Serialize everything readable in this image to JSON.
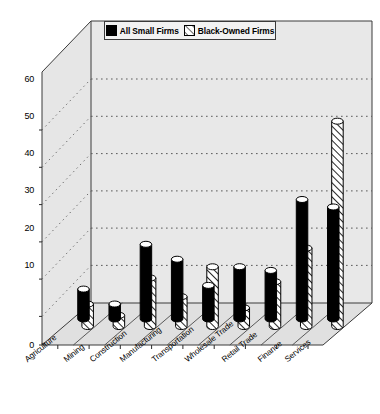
{
  "chart_data": {
    "type": "bar",
    "title": "",
    "subtitle": "",
    "xlabel": "",
    "ylabel": "",
    "ylim": [
      0,
      60
    ],
    "ytick_values": [
      0,
      10,
      20,
      30,
      40,
      50,
      60
    ],
    "ytick_labels": [
      "0",
      "10",
      "20",
      "30",
      "40",
      "50",
      "60"
    ],
    "grid": true,
    "grid_style": "dotted horizontal gridlines on back wall",
    "projection": "3d-isometric",
    "legend_position": "top-center",
    "categories": [
      "Agriculture",
      "Mining",
      "Construction",
      "Manufacturing",
      "Transportation",
      "Wholesale Trade",
      "Retail Trade",
      "Finance",
      "Services"
    ],
    "series": [
      {
        "name": "All Small Firms",
        "fill": "solid-black",
        "color": "#000000",
        "values": [
          8,
          4,
          20,
          16,
          9,
          14,
          13,
          32,
          30
        ]
      },
      {
        "name": "Black-Owned Firms",
        "fill": "diagonal-hatch",
        "color": "#ffffff",
        "values": [
          6,
          3,
          13,
          8,
          16,
          5,
          12,
          21,
          55
        ]
      }
    ],
    "annotations": []
  },
  "legend": {
    "entries": [
      {
        "label": "All Small Firms",
        "swatch": "solid-black-swatch"
      },
      {
        "label": "Black-Owned Firms",
        "swatch": "hatched-swatch"
      }
    ]
  },
  "colors": {
    "series1": "#000000",
    "series2": "#ffffff",
    "wall": "#e8e8e8",
    "floor": "#e0e0e0",
    "outline": "#3a3a3a",
    "background": "#ffffff"
  }
}
